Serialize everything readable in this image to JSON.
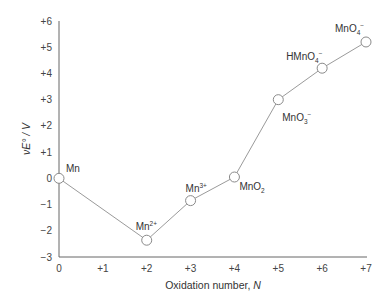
{
  "chart_data": {
    "type": "line",
    "title": "",
    "xlabel": "Oxidation number, N",
    "xlabel_main": "Oxidation number, ",
    "xlabel_italic": "N",
    "ylabel": "νE° / V",
    "xlim": [
      0,
      7
    ],
    "ylim": [
      -3,
      6
    ],
    "grid": false,
    "legend": null,
    "x_ticks": [
      "0",
      "+1",
      "+2",
      "+3",
      "+4",
      "+5",
      "+6",
      "+7"
    ],
    "y_ticks": [
      "+6",
      "+5",
      "+4",
      "+3",
      "+2",
      "+1",
      "0",
      "−1",
      "−2",
      "−3"
    ],
    "series": [
      {
        "name": "Manganese Frost diagram",
        "color": "#9a9a9a",
        "marker": "open-circle",
        "points": [
          {
            "x": 0,
            "y": 0.0,
            "label": "Mn",
            "base": "Mn",
            "sup": "",
            "sub": ""
          },
          {
            "x": 2,
            "y": -2.36,
            "label": "Mn2+",
            "base": "Mn",
            "sup": "2+",
            "sub": ""
          },
          {
            "x": 3,
            "y": -0.85,
            "label": "Mn3+",
            "base": "Mn",
            "sup": "3+",
            "sub": ""
          },
          {
            "x": 4,
            "y": 0.05,
            "label": "MnO2",
            "base": "MnO",
            "sup": "",
            "sub": "2"
          },
          {
            "x": 5,
            "y": 3.0,
            "label": "MnO3-",
            "base": "MnO",
            "sup": "−",
            "sub": "3"
          },
          {
            "x": 6,
            "y": 4.2,
            "label": "HMnO4-",
            "base": "HMnO",
            "sup": "−",
            "sub": "4"
          },
          {
            "x": 7,
            "y": 5.2,
            "label": "MnO4-",
            "base": "MnO",
            "sup": "−",
            "sub": "4"
          }
        ]
      }
    ]
  }
}
